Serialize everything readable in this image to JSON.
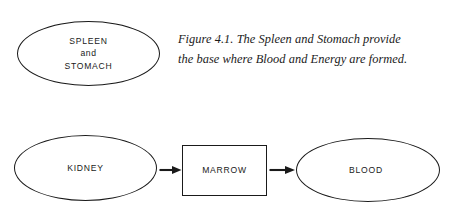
{
  "figure": {
    "caption_lines": [
      "Figure 4.1. The Spleen and Stomach provide",
      "the base where Blood and Energy are formed."
    ],
    "caption_full": "Figure 4.1. The Spleen and Stomach provide the base where Blood and Energy are formed."
  },
  "diagram": {
    "stroke_color": "#1a1a1a",
    "background_color": "#ffffff",
    "nodes": [
      {
        "id": "spleen-stomach",
        "shape": "ellipse",
        "lines": [
          "SPLEEN",
          "and",
          "STOMACH"
        ]
      },
      {
        "id": "kidney",
        "shape": "ellipse",
        "lines": [
          "KIDNEY"
        ]
      },
      {
        "id": "marrow",
        "shape": "rectangle",
        "lines": [
          "MARROW"
        ]
      },
      {
        "id": "blood",
        "shape": "ellipse",
        "lines": [
          "BLOOD"
        ]
      }
    ],
    "arrows": [
      {
        "id": "kidney-to-marrow",
        "from": "kidney",
        "to": "marrow",
        "direction": "right"
      },
      {
        "id": "marrow-to-blood",
        "from": "marrow",
        "to": "blood",
        "direction": "right"
      }
    ]
  }
}
